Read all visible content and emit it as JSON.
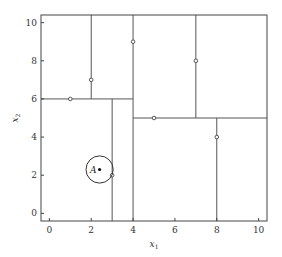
{
  "chart_data": {
    "type": "scatter",
    "title": "",
    "subtitle": "k-d tree partition of the plane with nearest-neighbor query",
    "xlabel": "x1",
    "ylabel": "x2",
    "xlabel_main": "x",
    "xlabel_sub": "1",
    "ylabel_main": "x",
    "ylabel_sub": "2",
    "xlim": [
      -0.4,
      10.4
    ],
    "ylim": [
      -0.4,
      10.4
    ],
    "xticks": [
      0,
      2,
      4,
      6,
      8,
      10
    ],
    "yticks": [
      0,
      2,
      4,
      6,
      8,
      10
    ],
    "xtick_labels": [
      "0",
      "2",
      "4",
      "6",
      "8",
      "10"
    ],
    "ytick_labels": [
      "0",
      "2",
      "4",
      "6",
      "8",
      "10"
    ],
    "grid": false,
    "legend": "none",
    "points": [
      {
        "x": 1,
        "y": 6
      },
      {
        "x": 2,
        "y": 7
      },
      {
        "x": 4,
        "y": 9
      },
      {
        "x": 5,
        "y": 5
      },
      {
        "x": 7,
        "y": 8
      },
      {
        "x": 8,
        "y": 4
      },
      {
        "x": 3,
        "y": 2
      }
    ],
    "splits": [
      {
        "orientation": "vertical",
        "at": 4,
        "from": -0.4,
        "to": 10.4
      },
      {
        "orientation": "horizontal",
        "at": 6,
        "from": -0.4,
        "to": 4
      },
      {
        "orientation": "vertical",
        "at": 2,
        "from": 6,
        "to": 10.4
      },
      {
        "orientation": "vertical",
        "at": 3,
        "from": -0.4,
        "to": 6
      },
      {
        "orientation": "horizontal",
        "at": 5,
        "from": 4,
        "to": 10.4
      },
      {
        "orientation": "vertical",
        "at": 7,
        "from": 5,
        "to": 10.4
      },
      {
        "orientation": "vertical",
        "at": 8,
        "from": -0.4,
        "to": 5
      }
    ],
    "query": {
      "label": "A",
      "x": 2.4,
      "y": 2.3,
      "radius": 0.65
    },
    "colors": {
      "line": "#555555",
      "frame": "#444444",
      "point": "#444444",
      "query": "#111111"
    }
  }
}
